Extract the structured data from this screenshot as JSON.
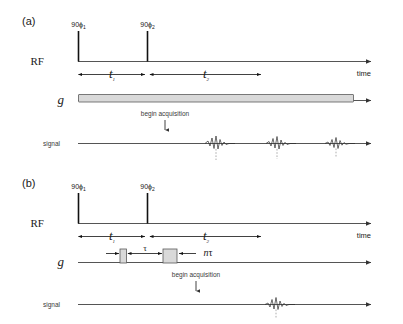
{
  "figure": {
    "panels": [
      {
        "id": "a",
        "label": "(a)",
        "rows": {
          "rf_label": "RF",
          "gradient_label": "g",
          "signal_label": "signal"
        },
        "axis_label": "time",
        "pulses": [
          {
            "label_main": "90",
            "label_phase": "ϕ",
            "label_sub": "1"
          },
          {
            "label_main": "90",
            "label_phase": "ϕ",
            "label_sub": "2"
          }
        ],
        "intervals": [
          {
            "label_main": "t",
            "label_sub": "1"
          },
          {
            "label_main": "t",
            "label_sub": "2"
          }
        ],
        "annotation": "begin acquisition",
        "gradient_type": "continuous-bar",
        "echo_count": 3
      },
      {
        "id": "b",
        "label": "(b)",
        "rows": {
          "rf_label": "RF",
          "gradient_label": "g",
          "signal_label": "signal"
        },
        "axis_label": "time",
        "pulses": [
          {
            "label_main": "90",
            "label_phase": "ϕ",
            "label_sub": "1"
          },
          {
            "label_main": "90",
            "label_phase": "ϕ",
            "label_sub": "2"
          }
        ],
        "intervals": [
          {
            "label_main": "t",
            "label_sub": "1"
          },
          {
            "label_main": "t",
            "label_sub": "2"
          }
        ],
        "gradient_intervals": [
          {
            "label": "τ"
          },
          {
            "label_main": "n",
            "label_tau": "τ"
          }
        ],
        "annotation": "begin acquisition",
        "gradient_type": "two-pulses",
        "echo_count": 1
      }
    ],
    "colors": {
      "background": "#ffffff",
      "axis": "#555555",
      "pulse": "#111111",
      "gradient_fill": "#d9d9d9",
      "gradient_stroke": "#5a5a5a",
      "echo": "#2b2b2b",
      "echo_dashed": "#8a8a8a",
      "text": "#1a1a1a"
    }
  }
}
